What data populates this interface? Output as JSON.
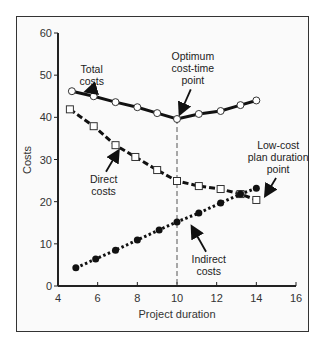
{
  "chart_data": {
    "type": "line",
    "title": "",
    "xlabel": "Project duration",
    "ylabel": "Costs",
    "xlim": [
      4,
      16
    ],
    "ylim": [
      0,
      60
    ],
    "x_ticks": [
      4,
      6,
      8,
      10,
      12,
      14,
      16
    ],
    "y_ticks": [
      0,
      10,
      20,
      30,
      40,
      50,
      60
    ],
    "grid": false,
    "legend": null,
    "series": [
      {
        "name": "Total costs",
        "style": "solid",
        "marker": "open-circle",
        "x": [
          4.7,
          5.8,
          6.9,
          8.0,
          9.0,
          10.0,
          11.1,
          12.2,
          13.2,
          14.0
        ],
        "y": [
          46.2,
          45.0,
          43.6,
          42.4,
          41.0,
          39.6,
          40.8,
          41.5,
          42.9,
          44.0
        ]
      },
      {
        "name": "Direct costs",
        "style": "dashed",
        "marker": "open-square",
        "x": [
          4.6,
          5.8,
          6.9,
          7.9,
          9.0,
          10.0,
          11.1,
          12.2,
          13.2,
          14.0
        ],
        "y": [
          41.9,
          37.9,
          33.4,
          30.6,
          27.5,
          24.9,
          23.7,
          23.0,
          21.8,
          20.4
        ]
      },
      {
        "name": "Indirect costs",
        "style": "dotted",
        "marker": "filled-circle",
        "x": [
          4.9,
          5.9,
          6.9,
          8.0,
          9.1,
          10.0,
          11.1,
          12.2,
          13.2,
          14.0
        ],
        "y": [
          4.3,
          6.4,
          8.5,
          10.9,
          13.3,
          15.2,
          17.3,
          19.7,
          21.8,
          23.2
        ]
      }
    ],
    "reference_lines": [
      {
        "type": "vertical",
        "x": 10,
        "style": "dashed",
        "label": "Optimum cost-time point"
      }
    ],
    "annotations": [
      {
        "text": [
          "Total",
          "costs"
        ],
        "label_x": 5.7,
        "label_y": 50.5,
        "arrow_to": [
          5.3,
          46.0
        ]
      },
      {
        "text": [
          "Optimum",
          "cost-time",
          "point"
        ],
        "label_x": 10.8,
        "label_y": 53.5,
        "arrow_to": [
          10.1,
          40.3
        ]
      },
      {
        "text": [
          "Low-cost",
          "plan duration",
          "point"
        ],
        "label_x": 15.1,
        "label_y": 32.5,
        "arrow_to": [
          14.4,
          21.0
        ]
      },
      {
        "text": [
          "Direct",
          "costs"
        ],
        "label_x": 6.3,
        "label_y": 24.5,
        "arrow_to": [
          7.1,
          32.5
        ]
      },
      {
        "text": [
          "Indirect",
          "costs"
        ],
        "label_x": 11.6,
        "label_y": 5.5,
        "arrow_to": [
          10.7,
          14.5
        ]
      }
    ]
  },
  "colors": {
    "line": "#111111",
    "axis": "#222222",
    "text": "#333333",
    "frame_bg": "#fafafa"
  }
}
